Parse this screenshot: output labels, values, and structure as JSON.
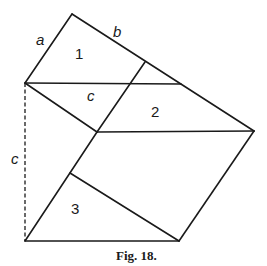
{
  "figure": {
    "caption": "Fig. 18.",
    "labels": {
      "a": "a",
      "b": "b",
      "c_inner": "c",
      "c_left": "c",
      "region_1": "1",
      "region_2": "2",
      "region_3": "3"
    },
    "colors": {
      "ink": "#1a1a1a",
      "background": "#ffffff"
    }
  }
}
